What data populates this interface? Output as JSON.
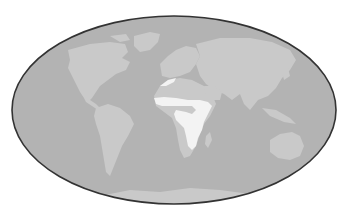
{
  "map": {
    "projection": "elliptical world map",
    "colors": {
      "background": "#ffffff",
      "ocean": "#b3b3b3",
      "land": "#c9c9c9",
      "highlight": "#f3f3f3",
      "outline": "#333333"
    },
    "highlighted_region": "Sub-Saharan Africa band (Sahel, Central and East Africa, North African coast strip)",
    "continents": [
      "North America",
      "Greenland",
      "South America",
      "Europe",
      "Africa",
      "Asia",
      "Australia",
      "Antarctica"
    ]
  }
}
